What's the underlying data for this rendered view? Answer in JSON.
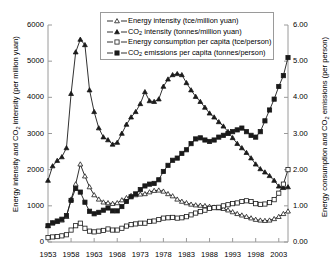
{
  "chart_data": {
    "type": "line",
    "title": "",
    "xlabel": "",
    "ylabel_left": "Energy intensity and CO2 intensity (per million yuan)",
    "ylabel_right": "Energy consumption and CO2 emissions (per person)",
    "x": [
      1953,
      1954,
      1955,
      1956,
      1957,
      1958,
      1959,
      1960,
      1961,
      1962,
      1963,
      1964,
      1965,
      1966,
      1967,
      1968,
      1969,
      1970,
      1971,
      1972,
      1973,
      1974,
      1975,
      1976,
      1977,
      1978,
      1979,
      1980,
      1981,
      1982,
      1983,
      1984,
      1985,
      1986,
      1987,
      1988,
      1989,
      1990,
      1991,
      1992,
      1993,
      1994,
      1995,
      1996,
      1997,
      1998,
      1999,
      2000,
      2001,
      2002,
      2003,
      2004,
      2005
    ],
    "xlim": [
      1953,
      2005
    ],
    "xticks": [
      1953,
      1958,
      1963,
      1968,
      1973,
      1978,
      1983,
      1988,
      1993,
      1998,
      2003
    ],
    "ylim_left": [
      0,
      6000
    ],
    "yticks_left": [
      0,
      1000,
      2000,
      3000,
      4000,
      5000,
      6000
    ],
    "ylim_right": [
      0,
      6.0
    ],
    "yticks_right": [
      "0.00",
      "1.00",
      "2.00",
      "3.00",
      "4.00",
      "5.00",
      "6.00"
    ],
    "grid": false,
    "legend_position": "top-center",
    "series": [
      {
        "name": "Energy intensity (tce/million yuan)",
        "axis": "left",
        "marker": "open-triangle",
        "values": [
          450,
          520,
          560,
          600,
          700,
          1180,
          1600,
          2150,
          1820,
          1520,
          1300,
          1180,
          1100,
          1080,
          1060,
          1080,
          1160,
          1220,
          1280,
          1300,
          1320,
          1330,
          1380,
          1420,
          1430,
          1400,
          1330,
          1270,
          1180,
          1120,
          1080,
          1040,
          1020,
          1010,
          1000,
          980,
          960,
          940,
          920,
          880,
          830,
          780,
          740,
          700,
          660,
          620,
          600,
          590,
          600,
          640,
          700,
          780,
          850
        ]
      },
      {
        "name": "CO2 intensity (tonnes/million yuan)",
        "axis": "left",
        "marker": "filled-triangle",
        "values": [
          1700,
          2100,
          2250,
          2350,
          2600,
          4100,
          5250,
          5600,
          5450,
          4200,
          3600,
          3150,
          2900,
          2820,
          2700,
          2750,
          3000,
          3250,
          3450,
          3600,
          3820,
          4150,
          3900,
          3880,
          3950,
          4300,
          4500,
          4620,
          4650,
          4620,
          4400,
          4200,
          4020,
          3880,
          3720,
          3560,
          3450,
          3320,
          3200,
          3050,
          2880,
          2720,
          2600,
          2470,
          2320,
          2150,
          2020,
          1930,
          1830,
          1700,
          1540,
          1500,
          1520
        ]
      },
      {
        "name": "Energy consumption per capita (tce/person)",
        "axis": "right",
        "marker": "open-square",
        "values": [
          0.12,
          0.14,
          0.15,
          0.17,
          0.2,
          0.33,
          0.45,
          0.52,
          0.38,
          0.3,
          0.28,
          0.3,
          0.32,
          0.36,
          0.33,
          0.33,
          0.38,
          0.44,
          0.48,
          0.5,
          0.52,
          0.52,
          0.57,
          0.58,
          0.62,
          0.66,
          0.67,
          0.68,
          0.66,
          0.67,
          0.7,
          0.75,
          0.8,
          0.84,
          0.88,
          0.93,
          0.95,
          0.96,
          1.0,
          1.03,
          1.06,
          1.08,
          1.12,
          1.14,
          1.12,
          1.06,
          1.04,
          1.05,
          1.09,
          1.17,
          1.35,
          1.6,
          2.0
        ]
      },
      {
        "name": "CO2 emissions per capita (tonnes/person)",
        "axis": "right",
        "marker": "filled-square",
        "values": [
          0.45,
          0.53,
          0.58,
          0.63,
          0.73,
          1.15,
          1.48,
          1.38,
          1.1,
          0.85,
          0.78,
          0.82,
          0.88,
          0.94,
          0.86,
          0.86,
          0.98,
          1.12,
          1.25,
          1.33,
          1.45,
          1.55,
          1.6,
          1.62,
          1.72,
          1.95,
          2.12,
          2.26,
          2.32,
          2.45,
          2.55,
          2.72,
          2.85,
          2.88,
          2.82,
          2.78,
          2.82,
          2.9,
          2.95,
          3.0,
          3.05,
          3.1,
          3.15,
          3.05,
          2.95,
          2.9,
          3.05,
          3.35,
          3.65,
          3.95,
          4.3,
          4.6,
          5.1
        ]
      }
    ]
  },
  "legend": {
    "items": [
      {
        "label_pre": "Energy intensity (tce/million yuan)",
        "sub": "",
        "label_post": "",
        "marker": "open-triangle"
      },
      {
        "label_pre": "CO",
        "sub": "2",
        "label_post": " intensity (tonnes/million yuan)",
        "marker": "filled-triangle"
      },
      {
        "label_pre": "Energy consumption per capita (tce/person)",
        "sub": "",
        "label_post": "",
        "marker": "open-square"
      },
      {
        "label_pre": "CO",
        "sub": "2",
        "label_post": " emissions per capita (tonnes/person)",
        "marker": "filled-square"
      }
    ]
  },
  "axes": {
    "left_title_pre": "Energy intensity and CO",
    "left_title_sub": "2",
    "left_title_post": " intensity (per million yuan)",
    "right_title_pre": "Energy consumption and CO",
    "right_title_sub": "2",
    "right_title_post": " emissions (per person)"
  },
  "colors": {
    "line": "#1a1a1a",
    "axis": "#9a9a9a",
    "background": "#ffffff",
    "legend_border": "#9a9a9a"
  }
}
